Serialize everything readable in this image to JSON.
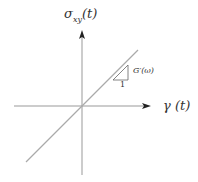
{
  "diagram": {
    "y_axis_label": "σxy(t)",
    "y_axis_label_main": "σ",
    "y_axis_label_sub": "xy",
    "y_axis_label_arg": "(t)",
    "x_axis_label": "γ (t)",
    "slope_label": "G′(ω)",
    "slope_run_label": "1",
    "colors": {
      "axis": "#999999",
      "line": "#aaaaaa",
      "arrow": "#222222",
      "text": "#333333"
    }
  }
}
